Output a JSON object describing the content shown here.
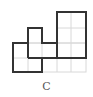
{
  "figure": {
    "caption": "C",
    "grid_color": "#d8d8d8",
    "outline_color": "#333333"
  }
}
